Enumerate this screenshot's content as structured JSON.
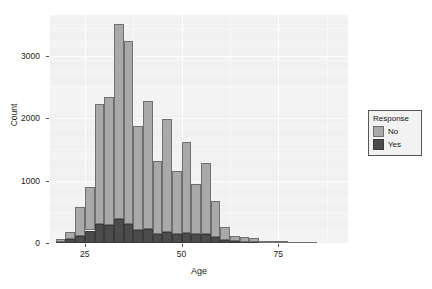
{
  "chart_data": {
    "type": "bar",
    "title": "",
    "subtitle": "",
    "xlabel": "Age",
    "ylabel": "Count",
    "xlim": [
      16,
      93
    ],
    "ylim": [
      0,
      3650
    ],
    "xticks": [
      25,
      50,
      75
    ],
    "yticks": [
      0,
      1000,
      2000,
      3000
    ],
    "grid": true,
    "stacked": true,
    "bin_width": 2.5,
    "legend": {
      "title": "Response",
      "position": "right",
      "entries": [
        {
          "name": "No",
          "color": "#a9a9a9"
        },
        {
          "name": "Yes",
          "color": "#4c4c4c"
        }
      ]
    },
    "bin_centers": [
      18.75,
      21.25,
      23.75,
      26.25,
      28.75,
      31.25,
      33.75,
      36.25,
      38.75,
      41.25,
      43.75,
      46.25,
      48.75,
      51.25,
      53.75,
      56.25,
      58.75,
      61.25,
      63.75,
      66.25,
      68.75,
      71.25,
      73.75,
      76.25,
      78.75,
      81.25,
      83.75,
      86.25,
      88.75,
      91.25
    ],
    "categories": [
      "18.75",
      "21.25",
      "23.75",
      "26.25",
      "28.75",
      "31.25",
      "33.75",
      "36.25",
      "38.75",
      "41.25",
      "43.75",
      "46.25",
      "48.75",
      "51.25",
      "53.75",
      "56.25",
      "58.75",
      "61.25",
      "63.75",
      "66.25",
      "68.75",
      "71.25",
      "73.75",
      "76.25",
      "78.75",
      "81.25",
      "83.75",
      "86.25",
      "88.75",
      "91.25"
    ],
    "series": [
      {
        "name": "No",
        "color": "#a9a9a9",
        "values": [
          50,
          120,
          450,
          700,
          1910,
          2040,
          3130,
          2930,
          1660,
          2060,
          1170,
          1810,
          1020,
          1460,
          810,
          1140,
          580,
          200,
          90,
          70,
          60,
          30,
          25,
          20,
          15,
          10,
          8,
          5,
          3,
          2
        ]
      },
      {
        "name": "Yes",
        "color": "#4c4c4c",
        "values": [
          20,
          60,
          120,
          200,
          310,
          290,
          380,
          300,
          210,
          220,
          150,
          170,
          140,
          160,
          140,
          140,
          100,
          50,
          25,
          20,
          15,
          10,
          8,
          6,
          5,
          4,
          3,
          2,
          2,
          1
        ]
      }
    ],
    "totals": [
      70,
      180,
      570,
      900,
      2220,
      2330,
      3510,
      3230,
      1870,
      2280,
      1320,
      1980,
      1160,
      1620,
      950,
      1280,
      680,
      250,
      115,
      90,
      75,
      40,
      33,
      26,
      20,
      14,
      11,
      7,
      5,
      3
    ]
  },
  "axes": {
    "y_label": "Count",
    "x_label": "Age",
    "y_tick_labels": [
      "0",
      "1000",
      "2000",
      "3000"
    ],
    "x_tick_labels": [
      "25",
      "50",
      "75"
    ]
  },
  "legend": {
    "title": "Response",
    "items": [
      {
        "label": "No"
      },
      {
        "label": "Yes"
      }
    ]
  },
  "colors": {
    "no": "#a9a9a9",
    "yes": "#4c4c4c",
    "panel_bg": "#f3f3f3",
    "grid": "#ffffff",
    "text": "#1a1a1a"
  }
}
